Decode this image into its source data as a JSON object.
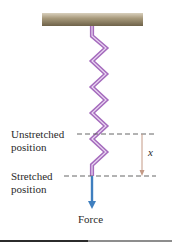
{
  "diagram": {
    "labels": {
      "unstretched_line1": "Unstretched",
      "unstretched_line2": "position",
      "stretched_line1": "Stretched",
      "stretched_line2": "position",
      "displacement": "x",
      "force": "Force"
    },
    "colors": {
      "spring": "#b07cc6",
      "spring_highlight": "#e6cff0",
      "force_arrow": "#3f7fbf",
      "displacement_arrow": "#c49a86",
      "dashed_line": "#555555",
      "ceiling_top": "#d9d0bd",
      "ceiling_bottom": "#6e6249"
    },
    "elements": [
      "ceiling",
      "spring",
      "unstretched-position-line",
      "stretched-position-line",
      "displacement-arrow",
      "force-arrow"
    ]
  }
}
